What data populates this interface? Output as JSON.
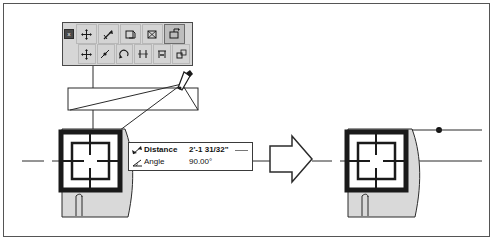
{
  "window": {
    "title": "",
    "background_color": "#ffffff",
    "border_color": "#555555"
  },
  "toolbar": {
    "name": "snap-overrides-toolbar",
    "background_color": "#d6d6d6",
    "close_label": "x",
    "rows": [
      {
        "buttons": [
          {
            "name": "toolbar-close-button",
            "icon": "close-icon",
            "label": "x",
            "pressed": false
          },
          {
            "name": "snap-move-button",
            "icon": "move-cross-icon",
            "label": "",
            "pressed": false
          },
          {
            "name": "snap-endpoint-button",
            "icon": "endpoint-arrow-icon",
            "label": "",
            "pressed": false
          },
          {
            "name": "snap-copy-button",
            "icon": "copy-rect-icon",
            "label": "",
            "pressed": false
          },
          {
            "name": "snap-insert-button",
            "icon": "insert-rect-icon",
            "label": "",
            "pressed": false
          },
          {
            "name": "snap-active-button",
            "icon": "active-rect-icon",
            "label": "",
            "pressed": true
          }
        ]
      },
      {
        "buttons": [
          {
            "name": "snap-pan-button",
            "icon": "four-arrow-icon",
            "label": "",
            "pressed": false
          },
          {
            "name": "snap-midpoint-button",
            "icon": "midpoint-icon",
            "label": "",
            "pressed": false
          },
          {
            "name": "snap-rotate-button",
            "icon": "rotate-arrow-icon",
            "label": "",
            "pressed": false
          },
          {
            "name": "snap-parallel-button",
            "icon": "parallel-lines-icon",
            "label": "",
            "pressed": false
          },
          {
            "name": "snap-dimension-button",
            "icon": "dimension-icon",
            "label": "",
            "pressed": false
          },
          {
            "name": "snap-offset-button",
            "icon": "offset-icon",
            "label": "",
            "pressed": false
          }
        ]
      }
    ]
  },
  "datatip": {
    "name": "dimension-datatip",
    "rows": [
      {
        "icon": "distance-icon",
        "label": "Distance",
        "value": "2'-1 31/32\"",
        "bold": true,
        "has_underline": true
      },
      {
        "icon": "angle-icon",
        "label": "Angle",
        "value": "90.00°",
        "bold": false,
        "has_underline": false
      }
    ]
  },
  "canvas": {
    "name": "drawing-canvas",
    "line_color": "#2b2b2b",
    "fill_color": "#d9d9d9",
    "left_object_label": "",
    "right_object_label": "",
    "arrow": {
      "name": "transform-arrow",
      "direction": "right"
    },
    "cursor": {
      "name": "pen-cursor",
      "x": 185,
      "y": 80
    },
    "snap_point": {
      "name": "snap-point-marker",
      "x": 439,
      "y": 130
    }
  }
}
